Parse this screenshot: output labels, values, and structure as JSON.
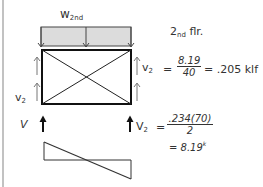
{
  "diagram": {
    "title_load": {
      "base": "w",
      "sub": "2nd"
    },
    "floor_label": {
      "prefix": "2",
      "sub": "nd",
      "suffix": " flr."
    },
    "unit_shear_eq": {
      "lhs_base": "v",
      "lhs_sub": "2",
      "equals": "=",
      "numerator": "8.19",
      "denominator": "40",
      "result": "= .205 klf"
    },
    "left_labels": {
      "v2_base": "v",
      "v2_sub": "2",
      "V": "V"
    },
    "reaction_eq": {
      "lhs_base": "V",
      "lhs_sub": "2",
      "equals": "=",
      "numerator": ".234(70)",
      "denominator": "2",
      "result": "= 8.19",
      "result_unit": "k"
    },
    "colors": {
      "line": "#222222",
      "load_fill": "#dcdcdc",
      "frame": "#111111"
    }
  }
}
